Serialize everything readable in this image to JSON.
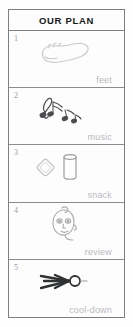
{
  "header": {
    "title": "OUR PLAN"
  },
  "rows": [
    {
      "num": "1",
      "label": "feet",
      "icon": "foot-icon"
    },
    {
      "num": "2",
      "label": "music",
      "icon": "music-notes-icon"
    },
    {
      "num": "3",
      "label": "snack",
      "icon": "cracker-and-cup-icon"
    },
    {
      "num": "4",
      "label": "review",
      "icon": "face-icon"
    },
    {
      "num": "5",
      "label": "cool-down",
      "icon": "stretching-figure-icon"
    }
  ],
  "colors": {
    "border": "#7d7f82",
    "divider": "#8a8c8f",
    "title": "#16181b",
    "label": "#b9babd",
    "number": "#9a9c9f",
    "artwork_light": "#c9cacd",
    "artwork_dark": "#2f3133",
    "background": "#fdfdfd"
  }
}
